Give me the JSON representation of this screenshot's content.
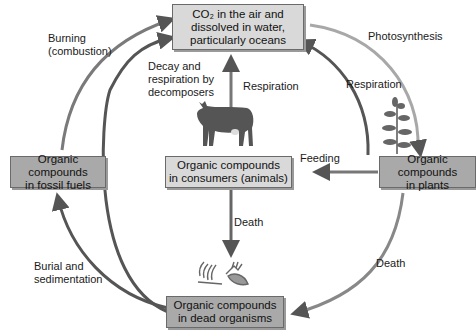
{
  "nodes": {
    "co2": {
      "line1": "CO₂ in the air and",
      "line2": "dissolved in water,",
      "line3": "particularly oceans"
    },
    "consumers": {
      "line1": "Organic compounds",
      "line2": "in consumers (animals)"
    },
    "plants": {
      "line1": "Organic compounds",
      "line2": "in plants"
    },
    "fossil": {
      "line1": "Organic compounds",
      "line2": "in fossil fuels"
    },
    "dead": {
      "line1": "Organic compounds",
      "line2": "in dead organisms"
    }
  },
  "labels": {
    "burning1": "Burning",
    "burning2": "(combustion)",
    "photosynthesis": "Photosynthesis",
    "decay1": "Decay and",
    "decay2": "respiration by",
    "decay3": "decomposers",
    "respiration_animal": "Respiration",
    "respiration_plant": "Respiration",
    "feeding": "Feeding",
    "death_animal": "Death",
    "death_plant": "Death",
    "burial1": "Burial and",
    "burial2": "sedimentation"
  },
  "colors": {
    "dark_arrow": "#555555",
    "light_arrow": "#a8a8a8",
    "box_light": "#d9d9d9",
    "box_dark": "#a9a9a9"
  },
  "icons": [
    "cow-icon",
    "plant-icon",
    "skeleton-icon"
  ]
}
